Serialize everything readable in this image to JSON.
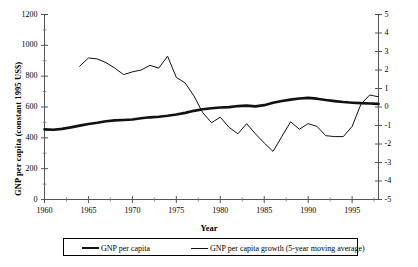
{
  "chart_data": {
    "type": "line",
    "title": "",
    "xlabel": "Year",
    "ylabel": "GNP per capita (constant 1995 US$)",
    "ylabel_right": "GNP per capita growth (annual %)",
    "xlim": [
      1960,
      1998
    ],
    "ylim": [
      0,
      1200
    ],
    "ylim_right": [
      -5,
      5
    ],
    "grid": false,
    "legend_position": "bottom",
    "xticks": [
      1960,
      1965,
      1970,
      1975,
      1980,
      1985,
      1990,
      1995
    ],
    "xtick_labels": [
      "1960",
      "1965",
      "1970",
      "1975",
      "1980",
      "1985",
      "1990",
      "1995"
    ],
    "yticks": [
      0,
      200,
      400,
      600,
      800,
      1000,
      1200
    ],
    "ytick_labels": [
      "0",
      "200",
      "400",
      "600",
      "800",
      "1000",
      "1200"
    ],
    "yticks_right": [
      -5,
      -4,
      -3,
      -2,
      -1,
      0,
      1,
      2,
      3,
      4,
      5
    ],
    "ytick_labels_right": [
      "-5",
      "-4",
      "-3",
      "-2",
      "-1",
      "0",
      "1",
      "2",
      "3",
      "4",
      "5"
    ],
    "series": [
      {
        "name": "GNP per capita",
        "axis": "left",
        "style": "thick",
        "x": [
          1960,
          1961,
          1962,
          1963,
          1964,
          1965,
          1966,
          1967,
          1968,
          1969,
          1970,
          1971,
          1972,
          1973,
          1974,
          1975,
          1976,
          1977,
          1978,
          1979,
          1980,
          1981,
          1982,
          1983,
          1984,
          1985,
          1986,
          1987,
          1988,
          1989,
          1990,
          1991,
          1992,
          1993,
          1994,
          1995,
          1996,
          1997,
          1998
        ],
        "values": [
          455,
          452,
          458,
          468,
          479,
          490,
          498,
          508,
          513,
          516,
          519,
          527,
          533,
          537,
          543,
          551,
          562,
          575,
          585,
          592,
          597,
          599,
          606,
          609,
          604,
          612,
          628,
          639,
          648,
          655,
          659,
          654,
          645,
          638,
          632,
          628,
          625,
          623,
          620
        ]
      },
      {
        "name": "GNP per capita growth (5-year moving average)",
        "axis": "right",
        "style": "thin",
        "x": [
          1964,
          1965,
          1966,
          1967,
          1968,
          1969,
          1970,
          1971,
          1972,
          1973,
          1974,
          1975,
          1976,
          1977,
          1978,
          1979,
          1980,
          1981,
          1982,
          1983,
          1984,
          1985,
          1986,
          1987,
          1988,
          1989,
          1990,
          1991,
          1992,
          1993,
          1994,
          1995,
          1996,
          1997,
          1998
        ],
        "values": [
          2.2,
          2.65,
          2.6,
          2.4,
          2.1,
          1.75,
          1.9,
          2.0,
          2.25,
          2.1,
          2.75,
          1.6,
          1.3,
          0.6,
          -0.3,
          -0.85,
          -0.55,
          -1.1,
          -1.45,
          -0.9,
          -1.45,
          -1.95,
          -2.4,
          -1.6,
          -0.8,
          -1.2,
          -0.9,
          -1.05,
          -1.55,
          -1.6,
          -1.6,
          -1.05,
          0.15,
          0.65,
          0.55
        ]
      }
    ]
  },
  "legend": {
    "items": [
      {
        "label": "GNP per capita"
      },
      {
        "label": "GNP per capita growth (5-year moving average)"
      }
    ]
  }
}
